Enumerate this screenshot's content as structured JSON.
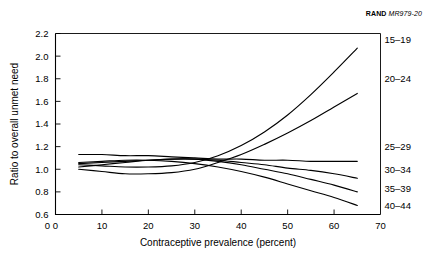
{
  "source_note": {
    "brand": "RAND",
    "code": "MR979-20"
  },
  "chart_data": {
    "type": "line",
    "title": "",
    "xlabel": "Contraceptive prevalence (percent)",
    "ylabel": "Ratio to overall unmet need",
    "xlim": [
      0,
      70
    ],
    "ylim": [
      0.6,
      2.2
    ],
    "xticks": [
      0,
      10,
      20,
      30,
      40,
      50,
      60,
      70
    ],
    "xtick_labels": [
      "0",
      "10",
      "20",
      "30",
      "40",
      "50",
      "60",
      "70"
    ],
    "yticks": [
      0.6,
      0.8,
      1.0,
      1.2,
      1.4,
      1.6,
      1.8,
      2.0,
      2.2
    ],
    "ytick_labels": [
      "0.6",
      "0.8",
      "1.0",
      "1.2",
      "1.4",
      "1.6",
      "1.8",
      "2.0",
      "2.2"
    ],
    "origin_label": "0",
    "grid": false,
    "legend_position": "right-inline",
    "line_color": "#000000",
    "x": [
      5,
      10,
      15,
      20,
      25,
      30,
      35,
      40,
      45,
      50,
      55,
      60,
      65
    ],
    "series": [
      {
        "name": "15-19",
        "label": "15–19",
        "values": [
          1.04,
          1.03,
          1.02,
          1.02,
          1.03,
          1.06,
          1.12,
          1.21,
          1.33,
          1.48,
          1.66,
          1.86,
          2.07
        ]
      },
      {
        "name": "20-24",
        "label": "20–24",
        "values": [
          1.0,
          0.98,
          0.96,
          0.96,
          0.97,
          1.0,
          1.06,
          1.13,
          1.22,
          1.32,
          1.43,
          1.55,
          1.67
        ]
      },
      {
        "name": "25-29",
        "label": "25–29",
        "values": [
          1.13,
          1.13,
          1.12,
          1.12,
          1.11,
          1.1,
          1.09,
          1.09,
          1.08,
          1.08,
          1.07,
          1.07,
          1.07
        ]
      },
      {
        "name": "30-34",
        "label": "30–34",
        "values": [
          1.05,
          1.06,
          1.07,
          1.08,
          1.09,
          1.09,
          1.08,
          1.06,
          1.04,
          1.01,
          0.99,
          0.96,
          0.92
        ]
      },
      {
        "name": "35-39",
        "label": "35–39",
        "values": [
          1.02,
          1.04,
          1.06,
          1.08,
          1.09,
          1.09,
          1.07,
          1.04,
          1.0,
          0.96,
          0.91,
          0.86,
          0.8
        ]
      },
      {
        "name": "40-44",
        "label": "40–44",
        "values": [
          1.06,
          1.07,
          1.08,
          1.08,
          1.07,
          1.05,
          1.02,
          0.98,
          0.93,
          0.87,
          0.81,
          0.75,
          0.68
        ]
      }
    ]
  }
}
